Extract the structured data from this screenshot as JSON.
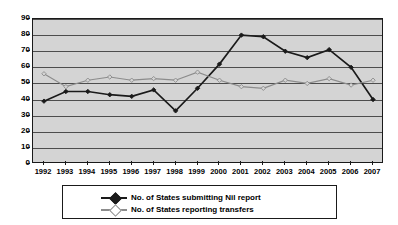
{
  "chart_data": {
    "type": "line",
    "title": "",
    "xlabel": "",
    "ylabel": "",
    "ylim": [
      0,
      90
    ],
    "ytick_step": 10,
    "yticks": [
      0,
      10,
      20,
      30,
      40,
      50,
      60,
      70,
      80,
      90
    ],
    "grid": true,
    "legend_position": "bottom",
    "categories": [
      "1992",
      "1993",
      "1994",
      "1995",
      "1996",
      "1997",
      "1998",
      "1999",
      "2000",
      "2001",
      "2002",
      "2003",
      "2004",
      "2005",
      "2006",
      "2007"
    ],
    "series": [
      {
        "name": "No. of States submitting Nil report",
        "color": "#1a1a1a",
        "marker": "diamond",
        "values": [
          39,
          45,
          45,
          43,
          42,
          46,
          33,
          47,
          62,
          80,
          79,
          70,
          66,
          71,
          60,
          40
        ]
      },
      {
        "name": "No. of States reporting transfers",
        "color": "#8c8c8c",
        "marker": "diamond-open",
        "values": [
          56,
          48,
          52,
          54,
          52,
          53,
          52,
          57,
          52,
          48,
          47,
          52,
          50,
          53,
          49,
          52
        ]
      }
    ]
  },
  "style": {
    "plot_background": "#d4d4d4",
    "chart_background": "#ffffff",
    "border_color": "#1a1a1a",
    "gridline_color": "#4d4d4d"
  }
}
